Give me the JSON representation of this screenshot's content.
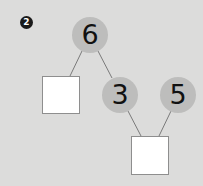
{
  "problem": {
    "number": "2"
  },
  "diagram": {
    "top_node": {
      "value": "6"
    },
    "middle_node": {
      "value": "3"
    },
    "side_node": {
      "value": "5"
    },
    "left_answer_box": {
      "value": ""
    },
    "bottom_answer_box": {
      "value": ""
    }
  },
  "colors": {
    "background": "#dcdcdb",
    "node_fill": "#bdbdbc",
    "box_fill": "#ffffff",
    "line": "#7a7a7a",
    "badge": "#1a1a1a"
  }
}
